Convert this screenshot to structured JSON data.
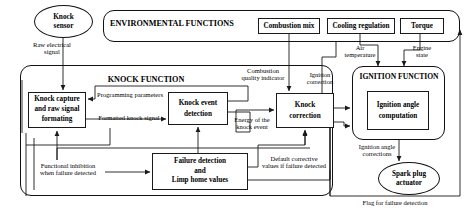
{
  "diagram": {
    "containers": [
      {
        "id": "environmental_functions",
        "label": "ENVIRONMENTAL FUNCTIONS"
      },
      {
        "id": "knock_function",
        "label": "KNOCK FUNCTION"
      },
      {
        "id": "ignition_function",
        "label": "IGNITION FUNCTION"
      }
    ],
    "nodes": {
      "knock_sensor": "Knock\nsensor",
      "knock_sensor_line1": "Knock",
      "knock_sensor_line2": "sensor",
      "combustion_mix": "Combustion mix",
      "cooling_regulation": "Cooling regulation",
      "torque": "Torque",
      "knock_capture_line1": "Knock capture",
      "knock_capture_line2": "and raw signal",
      "knock_capture_line3": "formating",
      "knock_event_line1": "Knock event",
      "knock_event_line2": "detection",
      "knock_correction_line1": "Knock",
      "knock_correction_line2": "correction",
      "failure_detection_line1": "Failure detection",
      "failure_detection_line2": "and",
      "failure_detection_line3": "Limp home values",
      "ignition_angle_line1": "Ignition angle",
      "ignition_angle_line2": "computation",
      "spark_plug_line1": "Spark plug",
      "spark_plug_line2": "actuator"
    },
    "edge_labels": {
      "raw_electrical_signal_l1": "Raw electrical",
      "raw_electrical_signal_l2": "signal",
      "programming_parameters": "Programming parameters",
      "formatted_knock_signal": "Formatted knock signal",
      "energy_of_knock_l1": "Energy of the",
      "energy_of_knock_l2": "knock event",
      "combustion_quality_l1": "Combustion",
      "combustion_quality_l2": "quality indicator",
      "ignition_correction_l1": "Ignition",
      "ignition_correction_l2": "correction",
      "air_temperature_l1": "Air",
      "air_temperature_l2": "temperature",
      "engine_state_l1": "Engine",
      "engine_state_l2": "state",
      "functional_inhibition_l1": "Functional inhibition",
      "functional_inhibition_l2": "when failure detected",
      "default_corrective_l1": "Default corrective",
      "default_corrective_l2": "values if failure detected",
      "ignition_angle_corrections_l1": "Ignition angle",
      "ignition_angle_corrections_l2": "corrections",
      "flag_for_failure_detection": "Flag for failure detection"
    },
    "colors": {
      "stroke": "#1a1a1a",
      "background": "#ffffff",
      "text": "#000000"
    }
  }
}
